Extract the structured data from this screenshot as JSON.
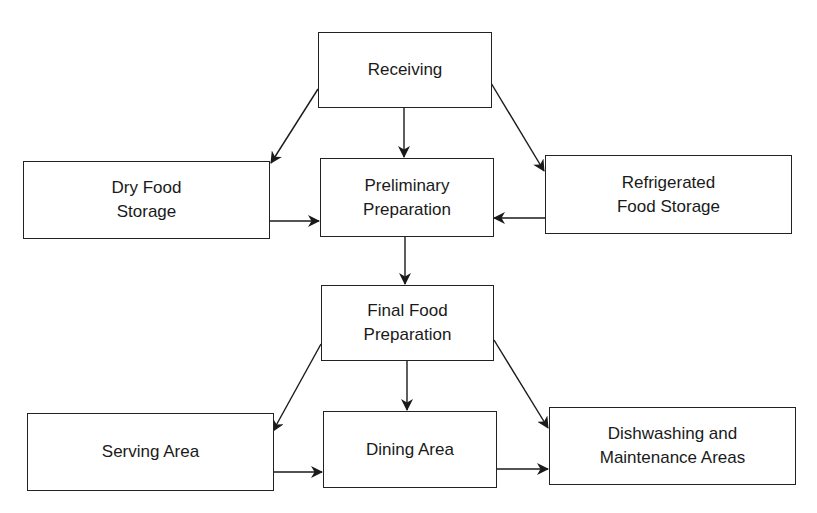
{
  "diagram": {
    "type": "flowchart",
    "nodes": {
      "receiving": {
        "lines": [
          "Receiving"
        ]
      },
      "dry_food_storage": {
        "lines": [
          "Dry Food",
          "Storage"
        ]
      },
      "preliminary_preparation": {
        "lines": [
          "Preliminary",
          "Preparation"
        ]
      },
      "refrigerated_food_storage": {
        "lines": [
          "Refrigerated",
          "Food Storage"
        ]
      },
      "final_food_preparation": {
        "lines": [
          "Final Food",
          "Preparation"
        ]
      },
      "serving_area": {
        "lines": [
          "Serving Area"
        ]
      },
      "dining_area": {
        "lines": [
          "Dining Area"
        ]
      },
      "dishwashing_maintenance": {
        "lines": [
          "Dishwashing and",
          "Maintenance Areas"
        ]
      }
    },
    "edges": [
      {
        "from": "receiving",
        "to": "dry_food_storage"
      },
      {
        "from": "receiving",
        "to": "preliminary_preparation"
      },
      {
        "from": "receiving",
        "to": "refrigerated_food_storage"
      },
      {
        "from": "dry_food_storage",
        "to": "preliminary_preparation"
      },
      {
        "from": "refrigerated_food_storage",
        "to": "preliminary_preparation"
      },
      {
        "from": "preliminary_preparation",
        "to": "final_food_preparation"
      },
      {
        "from": "final_food_preparation",
        "to": "serving_area"
      },
      {
        "from": "final_food_preparation",
        "to": "dining_area"
      },
      {
        "from": "final_food_preparation",
        "to": "dishwashing_maintenance"
      },
      {
        "from": "serving_area",
        "to": "dining_area"
      },
      {
        "from": "dining_area",
        "to": "dishwashing_maintenance"
      }
    ],
    "colors": {
      "stroke": "#222222",
      "background": "#ffffff",
      "text": "#1a1a1a"
    }
  }
}
